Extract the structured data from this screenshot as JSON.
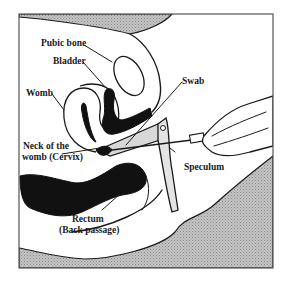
{
  "figure": {
    "type": "anatomical cross-section",
    "colors": {
      "background": "#ffffff",
      "outline": "#1a1a1a",
      "shaded_area": "#b8b8b8",
      "solid_organs": "#111111"
    }
  },
  "labels": {
    "pubic_bone": "Pubic bone",
    "bladder": "Bladder",
    "womb": "Womb",
    "swab": "Swab",
    "cervix_line1": "Neck of the",
    "cervix_line2": "womb (Cervix)",
    "speculum": "Speculum",
    "rectum_line1": "Rectum",
    "rectum_line2": "(Back passage)"
  }
}
